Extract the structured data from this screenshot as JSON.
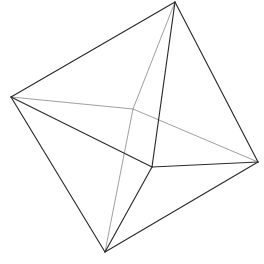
{
  "figure": {
    "shape_name": "octahedron",
    "background_color": "#ffffff",
    "visible_edge_color": "#2b2b2f",
    "hidden_edge_color": "#9a9aa0",
    "visible_edge_width": 1.15,
    "hidden_edge_width": 0.95,
    "canvas_width": 264,
    "canvas_height": 264,
    "vertex_count": 6,
    "edge_count": 12,
    "face_count": 8
  },
  "vertices": [
    {
      "id": "top",
      "label": "top vertex",
      "x": 175,
      "y": 2,
      "hidden": false
    },
    {
      "id": "left",
      "label": "left vertex",
      "x": 11,
      "y": 97,
      "hidden": false
    },
    {
      "id": "right",
      "label": "right vertex",
      "x": 258,
      "y": 162,
      "hidden": false
    },
    {
      "id": "bottom",
      "label": "bottom vertex",
      "x": 105,
      "y": 252,
      "hidden": false
    },
    {
      "id": "front",
      "label": "front vertex",
      "x": 152,
      "y": 167,
      "hidden": false
    },
    {
      "id": "back",
      "label": "back hidden vertex",
      "x": 133,
      "y": 109,
      "hidden": true
    }
  ],
  "edges": [
    {
      "id": "top-left",
      "from": "top",
      "to": "left",
      "hidden": false
    },
    {
      "id": "top-right",
      "from": "top",
      "to": "right",
      "hidden": false
    },
    {
      "id": "top-front",
      "from": "top",
      "to": "front",
      "hidden": false
    },
    {
      "id": "top-back",
      "from": "top",
      "to": "back",
      "hidden": true
    },
    {
      "id": "left-front",
      "from": "left",
      "to": "front",
      "hidden": false
    },
    {
      "id": "left-bottom",
      "from": "left",
      "to": "bottom",
      "hidden": false
    },
    {
      "id": "left-back",
      "from": "left",
      "to": "back",
      "hidden": true
    },
    {
      "id": "right-front",
      "from": "right",
      "to": "front",
      "hidden": false
    },
    {
      "id": "right-bottom",
      "from": "right",
      "to": "bottom",
      "hidden": false
    },
    {
      "id": "right-back",
      "from": "right",
      "to": "back",
      "hidden": true
    },
    {
      "id": "bottom-front",
      "from": "bottom",
      "to": "front",
      "hidden": false
    },
    {
      "id": "bottom-back",
      "from": "bottom",
      "to": "back",
      "hidden": true
    }
  ]
}
